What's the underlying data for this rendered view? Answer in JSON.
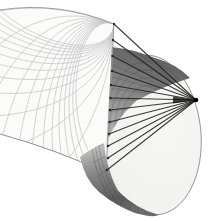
{
  "figure": {
    "canvas": {
      "width": 208,
      "height": 221
    },
    "background": "#ffffff",
    "colors": {
      "sheet_fill": "#fbfbfa",
      "sheet_grid": "#c2c2c6",
      "sheet_edge": "#9a9a9e",
      "sheet_edge_bottom": "#8f8f92",
      "disk_outline": "#8c8c8c",
      "ray": "#1f1f1f",
      "ray_dot": "#2a2a2a",
      "wedge": "#101010",
      "vertex": "#050505",
      "surface_line": "#3f3f3f"
    },
    "sheet": {
      "outline_path": "M114,24 Q58,1 0,10 L0,134 Q55,149 106,173 Z",
      "top_edge_path": "M114,24 Q58,1 0,10",
      "bottom_edge_path": "M0,134 Q55,149 106,173",
      "right_edge": {
        "x1": 114,
        "y1": 24,
        "x2": 106,
        "y2": 173
      },
      "grid": {
        "corner": [
          114,
          24
        ],
        "v1": [
          -0.053,
          0.999
        ],
        "v2": [
          -0.93,
          -0.37
        ],
        "lambda1": 0.55,
        "lambda2": 0.5,
        "scale": 950,
        "count": 13,
        "stroke_width": 0.75
      }
    },
    "disk": {
      "cx": 151,
      "cy": 135,
      "rx": 50,
      "ry": 80,
      "rotation": -5,
      "outline_width": 0.9,
      "gradient": {
        "cx": 0.62,
        "cy": 0.4,
        "r": 0.85,
        "stops": [
          [
            0,
            "#f7f7f6"
          ],
          [
            0.7,
            "#f2f2f0"
          ],
          [
            1,
            "#e9e9e6"
          ]
        ]
      },
      "clip_right_of_edge": "M114,0 L114,24 L103.5,221 L208,221 L208,0 Z"
    },
    "band": {
      "path": "M112,47 Q132,49 152,57 Q177,64 190,78 Q161,87 136,101 Q115,120 107,142 L106,152 Z",
      "gradient": {
        "x1": 150,
        "y1": 52,
        "x2": 104,
        "y2": 152,
        "stops": [
          [
            0,
            "#5f5f5f"
          ],
          [
            0.45,
            "#8b8b8b"
          ],
          [
            1,
            "#cacaca"
          ]
        ]
      },
      "ring_scales": [
        0.92,
        0.82,
        0.72,
        0.62
      ],
      "radial_targets": [
        [
          124,
          50
        ],
        [
          140,
          54
        ],
        [
          112,
          52
        ],
        [
          110,
          64
        ],
        [
          109,
          76
        ],
        [
          108,
          88
        ],
        [
          107,
          100
        ],
        [
          107,
          112
        ],
        [
          106,
          124
        ],
        [
          106,
          136
        ]
      ]
    },
    "bulge": {
      "path": "M80,157 Q85,180 99,192 Q116,206 135,213 Q152,218 159,215 Q136,209 117,190 Q106,166 104,143 Q92,148 80,157 Z",
      "gradient": {
        "x1": 100,
        "y1": 142,
        "x2": 118,
        "y2": 214,
        "stops": [
          [
            0,
            "#c9c9c9"
          ],
          [
            0.35,
            "#8c8c8c"
          ],
          [
            0.8,
            "#5b5b5b"
          ],
          [
            1,
            "#6b6b6b"
          ]
        ]
      },
      "ring_scales": [
        1.06,
        1.13,
        1.2
      ],
      "meridians": {
        "phi_start": 95,
        "phi_end": 178,
        "step": 9,
        "s_inner": 0.98,
        "s_outer": 1.24
      }
    },
    "rays": {
      "vertex": [
        196,
        100
      ],
      "endpoints": [
        [
          114,
          24
        ],
        [
          113,
          40
        ],
        [
          112.5,
          56
        ],
        [
          112,
          71
        ],
        [
          111,
          85
        ],
        [
          110.5,
          98
        ],
        [
          110,
          110
        ],
        [
          109.5,
          122
        ],
        [
          109,
          134
        ],
        [
          108,
          146
        ],
        [
          108,
          158
        ],
        [
          107,
          170
        ]
      ],
      "width": 1.05,
      "dot_radius": 1.2,
      "wedge_points": "196,100 173,96.5 173,103.5",
      "vertex_radius": 2.3
    }
  }
}
